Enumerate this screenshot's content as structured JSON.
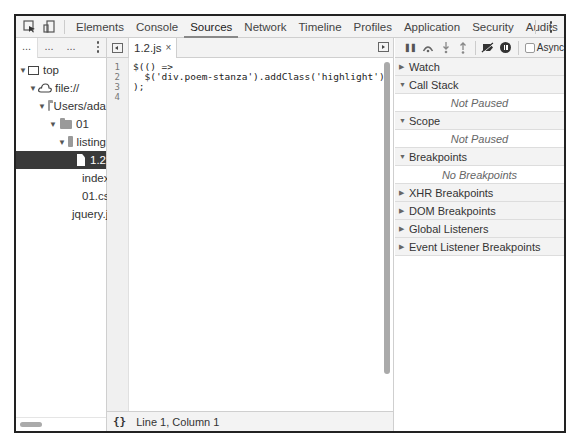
{
  "toolbar": {
    "inspect_icon": "inspect-element-icon",
    "device_icon": "device-mode-icon",
    "tabs": [
      {
        "label": "Elements",
        "active": false
      },
      {
        "label": "Console",
        "active": false
      },
      {
        "label": "Sources",
        "active": true
      },
      {
        "label": "Network",
        "active": false
      },
      {
        "label": "Timeline",
        "active": false
      },
      {
        "label": "Profiles",
        "active": false
      },
      {
        "label": "Application",
        "active": false
      },
      {
        "label": "Security",
        "active": false
      },
      {
        "label": "Audits",
        "active": false
      }
    ],
    "menu_icon": "kebab-menu-icon"
  },
  "navigator": {
    "tabs": [
      "...",
      "...",
      "..."
    ],
    "tree": [
      {
        "label": "top",
        "depth": 0,
        "type": "frame",
        "expanded": true
      },
      {
        "label": "file://",
        "depth": 1,
        "type": "cloud",
        "expanded": true
      },
      {
        "label": "Users/ada",
        "depth": 2,
        "type": "folder",
        "expanded": true
      },
      {
        "label": "01",
        "depth": 3,
        "type": "folder",
        "expanded": true
      },
      {
        "label": "listing",
        "depth": 4,
        "type": "folder",
        "expanded": true
      },
      {
        "label": "1.2",
        "depth": 5,
        "type": "file",
        "selected": true
      },
      {
        "label": "index",
        "depth": 5,
        "type": "file"
      },
      {
        "label": "01.cs",
        "depth": 5,
        "type": "file"
      },
      {
        "label": "jquery.js",
        "depth": 4,
        "type": "file"
      }
    ]
  },
  "editor": {
    "open_tab": {
      "label": "1.2.js",
      "close": "×"
    },
    "line_numbers": [
      "1",
      "2",
      "3",
      "4"
    ],
    "code_lines": [
      "$(() =>",
      "  $('div.poem-stanza').addClass('highlight')",
      ");",
      ""
    ],
    "status": {
      "format_icon": "{}",
      "position": "Line 1, Column 1"
    }
  },
  "debugger": {
    "toolbar": {
      "pause": "❚❚",
      "step_over": "↷",
      "step_into": "↓",
      "step_out": "↑",
      "deactivate_breakpoints": "deactivate-breakpoints-icon",
      "pause_on_exceptions": "pause-on-exceptions-icon",
      "async_label": "Async"
    },
    "panes": [
      {
        "title": "Watch",
        "expanded": false
      },
      {
        "title": "Call Stack",
        "expanded": true,
        "body": "Not Paused"
      },
      {
        "title": "Scope",
        "expanded": true,
        "body": "Not Paused"
      },
      {
        "title": "Breakpoints",
        "expanded": true,
        "body": "No Breakpoints"
      },
      {
        "title": "XHR Breakpoints",
        "expanded": false
      },
      {
        "title": "DOM Breakpoints",
        "expanded": false
      },
      {
        "title": "Global Listeners",
        "expanded": false
      },
      {
        "title": "Event Listener Breakpoints",
        "expanded": false
      }
    ]
  }
}
